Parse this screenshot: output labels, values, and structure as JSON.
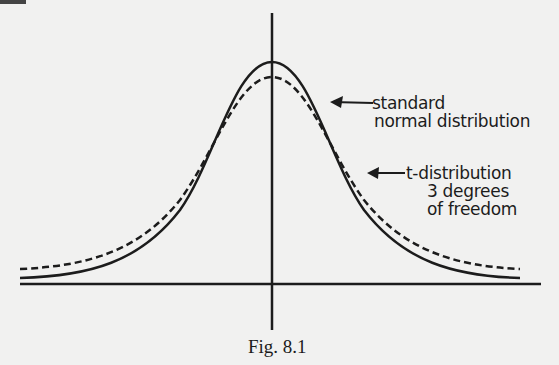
{
  "figure": {
    "caption": "Fig. 8.1",
    "labels": {
      "normal_line1": "standard",
      "normal_line2": "normal distribution",
      "t_line1": "t-distribution",
      "t_line2": "3 degrees",
      "t_line3": "of freedom"
    },
    "colors": {
      "ink": "#1c1c1c",
      "paper": "#f1f1f0"
    }
  },
  "curves": [
    {
      "name": "standard normal distribution",
      "style": "solid"
    },
    {
      "name": "t-distribution 3 degrees of freedom",
      "style": "dashed"
    }
  ]
}
